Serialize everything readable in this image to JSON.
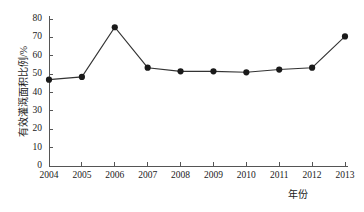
{
  "chart_data": {
    "type": "line",
    "title": "",
    "subtitle": "",
    "xlabel": "年份",
    "ylabel": "有效灌溉面积比例/%",
    "categories": [
      "2004",
      "2005",
      "2006",
      "2007",
      "2008",
      "2009",
      "2010",
      "2011",
      "2012",
      "2013"
    ],
    "x": [
      2004,
      2005,
      2006,
      2007,
      2008,
      2009,
      2010,
      2011,
      2012,
      2013
    ],
    "values": [
      47,
      48.5,
      75.5,
      53.5,
      51.5,
      51.5,
      51,
      52.5,
      53.5,
      70.5
    ],
    "series": [
      {
        "name": "有效灌溉面积比例",
        "values": [
          47,
          48.5,
          75.5,
          53.5,
          51.5,
          51.5,
          51,
          52.5,
          53.5,
          70.5
        ]
      }
    ],
    "ylim": [
      0,
      80
    ],
    "yticks": [
      0,
      10,
      20,
      30,
      40,
      50,
      60,
      70,
      80
    ],
    "ytick_labels": [
      "0",
      "10",
      "20",
      "30",
      "40",
      "50",
      "60",
      "70",
      "80"
    ],
    "xtick_labels": [
      "2004",
      "2005",
      "2006",
      "2007",
      "2008",
      "2009",
      "2010",
      "2011",
      "2012",
      "2013"
    ],
    "grid": false,
    "legend": false,
    "legend_position": "none",
    "marker": "filled-circle",
    "line_color": "#333333",
    "marker_color": "#1a1a1a",
    "background_color": "#ffffff",
    "axis_color": "#555555"
  }
}
